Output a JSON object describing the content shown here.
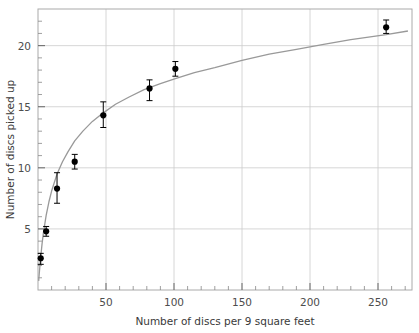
{
  "chart_data": {
    "type": "scatter",
    "title": "",
    "xlabel": "Number of discs per 9 square feet",
    "ylabel": "Number of discs picked up",
    "xlim": [
      0,
      275
    ],
    "ylim": [
      0,
      23
    ],
    "xticks": [
      50,
      100,
      150,
      200,
      250
    ],
    "xtick_labels": [
      "50",
      "100",
      "150",
      "200",
      "250"
    ],
    "yticks": [
      5,
      10,
      15,
      20
    ],
    "ytick_labels": [
      "5",
      "10",
      "15",
      "20"
    ],
    "minor_ticks": true,
    "grid": true,
    "legend": "none",
    "marker": "filled-circle",
    "marker_color": "#000000",
    "errorbar_color": "#000000",
    "curve_color": "#999999",
    "grid_color": "#cccccc",
    "frame_color": "#aaaaaa",
    "x": [
      2,
      6,
      14,
      27,
      48,
      82,
      101,
      256
    ],
    "y": [
      2.6,
      4.8,
      8.3,
      10.5,
      14.3,
      16.5,
      18.1,
      21.5
    ],
    "yerr_lower": [
      0.5,
      0.4,
      1.2,
      0.6,
      1.0,
      1.0,
      0.6,
      0.5
    ],
    "yerr_upper": [
      0.4,
      0.4,
      1.3,
      0.6,
      1.1,
      0.7,
      0.6,
      0.6
    ],
    "points": [
      {
        "x": 2,
        "y": 2.6,
        "err_low": 0.5,
        "err_high": 0.4
      },
      {
        "x": 6,
        "y": 4.8,
        "err_low": 0.4,
        "err_high": 0.4
      },
      {
        "x": 14,
        "y": 8.3,
        "err_low": 1.2,
        "err_high": 1.3
      },
      {
        "x": 27,
        "y": 10.5,
        "err_low": 0.6,
        "err_high": 0.6
      },
      {
        "x": 48,
        "y": 14.3,
        "err_low": 1.0,
        "err_high": 1.1
      },
      {
        "x": 82,
        "y": 16.5,
        "err_low": 1.0,
        "err_high": 0.7
      },
      {
        "x": 101,
        "y": 18.1,
        "err_low": 0.6,
        "err_high": 0.6
      },
      {
        "x": 256,
        "y": 21.5,
        "err_low": 0.5,
        "err_high": 0.6
      }
    ],
    "fit_curve": {
      "name": "fitted saturating curve",
      "x": [
        0.5,
        1,
        2,
        3,
        4,
        6,
        8,
        10,
        14,
        18,
        22,
        27,
        33,
        40,
        48,
        57,
        67,
        78,
        90,
        101,
        115,
        130,
        150,
        170,
        190,
        210,
        230,
        256,
        272
      ],
      "y": [
        0.75,
        1.45,
        2.7,
        3.8,
        4.7,
        6.1,
        7.2,
        8.1,
        9.5,
        10.5,
        11.3,
        12.2,
        13.0,
        13.8,
        14.5,
        15.2,
        15.8,
        16.4,
        16.9,
        17.3,
        17.8,
        18.2,
        18.8,
        19.3,
        19.7,
        20.1,
        20.5,
        20.9,
        21.2
      ]
    }
  },
  "plot_geometry": {
    "left": 38,
    "right": 412,
    "top": 9,
    "bottom": 290
  }
}
